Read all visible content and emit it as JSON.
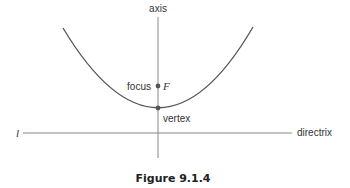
{
  "figure": {
    "caption": "Figure 9.1.4",
    "labels": {
      "axis": "axis",
      "focus": "focus",
      "focus_symbol": "F",
      "vertex": "vertex",
      "directrix": "directrix",
      "directrix_symbol": "l"
    },
    "colors": {
      "curve": "#555555",
      "line": "#888888",
      "point": "#555555"
    },
    "geometry": {
      "parabola": {
        "left": [
          63,
          28
        ],
        "vertex": [
          159,
          108
        ],
        "right": [
          253,
          27
        ]
      },
      "axis_x": 158,
      "focus": [
        159,
        86
      ],
      "directrix_y": 133
    }
  }
}
